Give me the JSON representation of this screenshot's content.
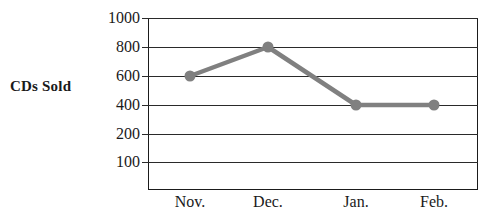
{
  "chart_data": {
    "type": "line",
    "title": "",
    "xlabel": "",
    "ylabel": "CDs Sold",
    "categories": [
      "Nov.",
      "Dec.",
      "Jan.",
      "Feb."
    ],
    "values": [
      600,
      800,
      400,
      400
    ],
    "series": [
      {
        "name": "CDs Sold",
        "values": [
          600,
          800,
          400,
          400
        ]
      }
    ],
    "y_tick_labels": [
      "1000",
      "800",
      "600",
      "400",
      "200",
      "100"
    ],
    "y_tick_values": [
      1000,
      800,
      600,
      400,
      200,
      100
    ],
    "ylim": [
      0,
      1000
    ],
    "grid": true,
    "legend": "none",
    "marker": "circle",
    "line_color": "#808080",
    "marker_color": "#808080",
    "grid_color": "#2a2a2a",
    "text_color": "#1a1a1a",
    "background_color": "#ffffff"
  },
  "axis": {
    "y_title": "CDs Sold",
    "y_labels": [
      {
        "text": "1000",
        "value": 1000
      },
      {
        "text": "800",
        "value": 800
      },
      {
        "text": "600",
        "value": 600
      },
      {
        "text": "400",
        "value": 400
      },
      {
        "text": "200",
        "value": 200
      },
      {
        "text": "100",
        "value": 100
      }
    ],
    "x_labels": [
      {
        "text": "Nov."
      },
      {
        "text": "Dec."
      },
      {
        "text": "Jan."
      },
      {
        "text": "Feb."
      }
    ]
  },
  "points": [
    {
      "label": "Nov.",
      "value": 600
    },
    {
      "label": "Dec.",
      "value": 800
    },
    {
      "label": "Jan.",
      "value": 400
    },
    {
      "label": "Feb.",
      "value": 400
    }
  ]
}
